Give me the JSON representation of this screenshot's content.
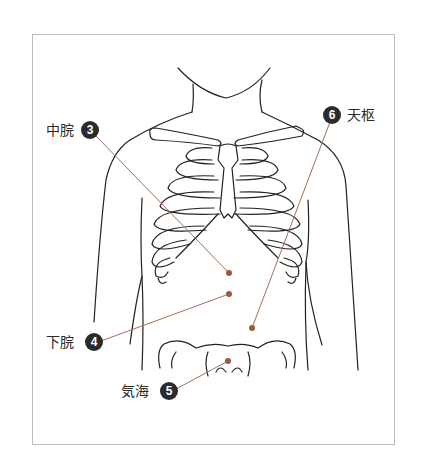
{
  "figure": {
    "title": "",
    "line_color": "#222222",
    "leader_color": "#a0705a",
    "point_color": "#9b5a3a",
    "badge_color": "#2b2b2b"
  },
  "points": [
    {
      "number": "3",
      "name": "中脘",
      "side": "left"
    },
    {
      "number": "4",
      "name": "下脘",
      "side": "left"
    },
    {
      "number": "5",
      "name": "気海",
      "side": "left"
    },
    {
      "number": "6",
      "name": "天枢",
      "side": "right"
    }
  ]
}
